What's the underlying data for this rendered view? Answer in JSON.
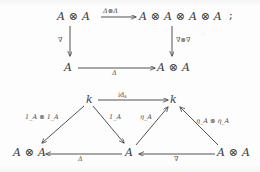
{
  "page": {
    "background_color": "#fdfdfd",
    "ink_color": "#3c3c3c",
    "width": 260,
    "height": 172
  },
  "diagram_top": {
    "name": "comultiplication-compatibility-square",
    "nodes": {
      "top_left": "A ⊗ A",
      "top_right": "A ⊗ A ⊗ A ⊗ A",
      "bottom_left": "A",
      "bottom_right": "A ⊗ A"
    },
    "arrows": {
      "top": {
        "label": "Δ⊗Δ",
        "from": "top_left",
        "to": "top_right",
        "direction": "right"
      },
      "left": {
        "label": "∇",
        "from": "top_left",
        "to": "bottom_left",
        "direction": "down"
      },
      "right": {
        "label": "∇⊗∇",
        "from": "top_right",
        "to": "bottom_right",
        "direction": "down"
      },
      "bottom": {
        "label": "Δ",
        "from": "bottom_left",
        "to": "bottom_right",
        "direction": "right"
      }
    },
    "trailing_punctuation": ";"
  },
  "diagram_bottom": {
    "name": "unit-counit-triangles",
    "nodes": {
      "k_left": "k",
      "k_right": "k",
      "left_tensor": "A ⊗ A",
      "center": "A",
      "right_tensor": "A ⊗ A"
    },
    "arrows": {
      "top": {
        "label": "id",
        "label_sub": "k",
        "from": "k_left",
        "to": "k_right",
        "direction": "right"
      },
      "left_diagonal": {
        "label": "1",
        "label_sub": "A",
        "label_full": "1_A ⊗ 1_A",
        "from": "k_left",
        "to": "left_tensor",
        "direction": "down-left"
      },
      "center_left_diagonal": {
        "label": "1",
        "label_sub": "A",
        "label_full": "1_A",
        "from": "k_left",
        "to": "center",
        "direction": "down-right"
      },
      "center_right_diagonal": {
        "label": "η",
        "label_sub": "A",
        "label_full": "η_A",
        "from": "center",
        "to": "k_right",
        "direction": "up-right"
      },
      "right_diagonal": {
        "label": "η",
        "label_sub": "A",
        "label_full": "η_A ⊗ η_A",
        "from": "right_tensor",
        "to": "k_right",
        "direction": "up-left"
      },
      "bottom_left": {
        "label": "Δ",
        "from": "center",
        "to": "left_tensor",
        "direction": "left"
      },
      "bottom_right": {
        "label": "∇",
        "from": "right_tensor",
        "to": "center",
        "direction": "left"
      }
    }
  }
}
